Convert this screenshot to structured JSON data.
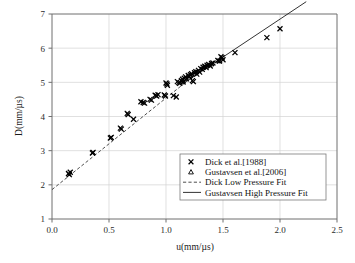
{
  "chart_data": {
    "type": "scatter",
    "title": "",
    "xlabel": "u(mm/µs)",
    "ylabel": "D(mm/µs)",
    "xlim": [
      0.0,
      2.5
    ],
    "ylim": [
      1,
      7
    ],
    "xticks": [
      "0.0",
      "0.5",
      "1.0",
      "1.5",
      "2.0",
      "2.5"
    ],
    "xtick_values": [
      0.0,
      0.5,
      1.0,
      1.5,
      2.0,
      2.5
    ],
    "yticks": [
      "1",
      "2",
      "3",
      "4",
      "5",
      "6",
      "7"
    ],
    "ytick_values": [
      1,
      2,
      3,
      4,
      5,
      6,
      7
    ],
    "grid": true,
    "legend_position": "lower-right",
    "series": [
      {
        "name": "Dick et al.[1988]",
        "marker": "cross",
        "points": [
          [
            0.145,
            2.33
          ],
          [
            0.16,
            2.37
          ],
          [
            0.152,
            2.3
          ],
          [
            0.355,
            2.93
          ],
          [
            0.36,
            2.95
          ],
          [
            0.512,
            3.37
          ],
          [
            0.52,
            3.39
          ],
          [
            0.6,
            3.66
          ],
          [
            0.608,
            3.63
          ],
          [
            0.66,
            4.09
          ],
          [
            0.668,
            4.06
          ],
          [
            0.715,
            3.92
          ],
          [
            0.78,
            4.43
          ],
          [
            0.8,
            4.41
          ],
          [
            0.812,
            4.39
          ],
          [
            0.86,
            4.5
          ],
          [
            0.872,
            4.48
          ],
          [
            0.905,
            4.62
          ],
          [
            0.918,
            4.6
          ],
          [
            0.93,
            4.64
          ],
          [
            0.985,
            4.63
          ],
          [
            0.995,
            4.6
          ],
          [
            1.0,
            4.98
          ],
          [
            1.008,
            4.95
          ],
          [
            1.012,
            4.91
          ],
          [
            1.065,
            4.61
          ],
          [
            1.09,
            4.57
          ],
          [
            1.1,
            5.02
          ],
          [
            1.112,
            4.99
          ],
          [
            1.12,
            4.97
          ],
          [
            1.135,
            5.05
          ],
          [
            1.145,
            5.09
          ],
          [
            1.15,
            5.01
          ],
          [
            1.16,
            5.12
          ],
          [
            1.172,
            5.16
          ],
          [
            1.18,
            5.1
          ],
          [
            1.195,
            5.2
          ],
          [
            1.205,
            5.17
          ],
          [
            1.215,
            5.22
          ],
          [
            1.225,
            5.25
          ],
          [
            1.232,
            5.05
          ],
          [
            1.24,
            5.02
          ],
          [
            1.25,
            5.28
          ],
          [
            1.262,
            5.31
          ],
          [
            1.27,
            5.24
          ],
          [
            1.285,
            5.35
          ],
          [
            1.295,
            5.3
          ],
          [
            1.305,
            5.4
          ],
          [
            1.318,
            5.38
          ],
          [
            1.325,
            5.44
          ],
          [
            1.34,
            5.47
          ],
          [
            1.352,
            5.43
          ],
          [
            1.36,
            5.5
          ],
          [
            1.375,
            5.52
          ],
          [
            1.388,
            5.48
          ],
          [
            1.4,
            5.55
          ],
          [
            1.412,
            5.57
          ],
          [
            1.455,
            5.64
          ],
          [
            1.468,
            5.62
          ],
          [
            1.482,
            5.75
          ],
          [
            1.492,
            5.72
          ],
          [
            1.5,
            5.66
          ],
          [
            1.605,
            5.87
          ],
          [
            1.885,
            6.31
          ],
          [
            2.0,
            6.57
          ]
        ]
      },
      {
        "name": "Gustavsen et al.[2006]",
        "marker": "triangle",
        "points": [
          [
            1.15,
            5.04
          ],
          [
            1.21,
            5.19
          ],
          [
            1.262,
            5.3
          ],
          [
            1.33,
            5.45
          ],
          [
            1.398,
            5.54
          ],
          [
            1.47,
            5.63
          ]
        ]
      }
    ],
    "fits": [
      {
        "name": "Dick Low Pressure Fit",
        "style": "dashed",
        "intercept": 1.86,
        "slope": 2.68,
        "x_range": [
          0.0,
          1.22
        ]
      },
      {
        "name": "Gustavsen High Pressure Fit",
        "style": "solid",
        "intercept": 2.41,
        "slope": 2.22,
        "x_range": [
          1.14,
          2.23
        ]
      }
    ],
    "legend": [
      {
        "label": "Dick et al.[1988]",
        "symbol": "cross"
      },
      {
        "label": "Gustavsen et al.[2006]",
        "symbol": "triangle"
      },
      {
        "label": "Dick Low Pressure Fit",
        "symbol": "dashed-line"
      },
      {
        "label": "Gustavsen High Pressure Fit",
        "symbol": "solid-line"
      }
    ],
    "colors": {
      "marker": "#000000",
      "grid": "#d2d2d2",
      "frame": "#6f6f6f",
      "background": "#ffffff"
    }
  }
}
